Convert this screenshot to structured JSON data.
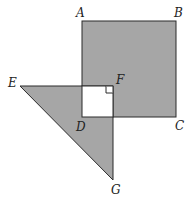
{
  "diagram": {
    "type": "geometry-figure",
    "colors": {
      "shade": "#a6a6a6",
      "stroke": "#2b2b2b",
      "background": "#ffffff",
      "inner_square": "#ffffff"
    },
    "points": {
      "A": {
        "label": "A",
        "x": 82,
        "y": 21
      },
      "B": {
        "label": "B",
        "x": 176,
        "y": 21
      },
      "C": {
        "label": "C",
        "x": 176,
        "y": 117
      },
      "D": {
        "label": "D",
        "x": 82,
        "y": 117
      },
      "E": {
        "label": "E",
        "x": 20,
        "y": 86
      },
      "F": {
        "label": "F",
        "x": 113,
        "y": 86
      },
      "G": {
        "label": "G",
        "x": 113,
        "y": 180
      }
    },
    "shapes": [
      {
        "name": "square-ABCD",
        "vertices": [
          "A",
          "B",
          "C",
          "D"
        ],
        "fill": "shaded"
      },
      {
        "name": "triangle-EFG",
        "vertices": [
          "E",
          "F",
          "G"
        ],
        "fill": "shaded"
      },
      {
        "name": "square-overlap",
        "vertices": [
          "F",
          "D"
        ],
        "fill": "white",
        "note": "overlap region of square and triangle is unshaded"
      }
    ],
    "right_angle_marker": {
      "at": "F"
    }
  }
}
